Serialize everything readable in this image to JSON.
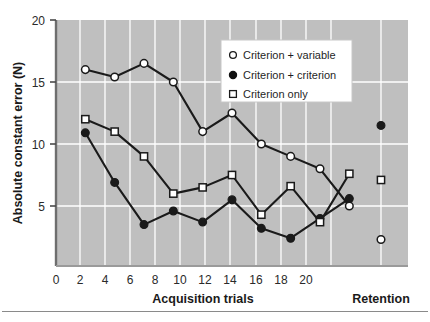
{
  "chart_data": {
    "type": "line",
    "title": "",
    "xlabel": "Acquisition trials",
    "ylabel": "Absolute constant error (N)",
    "x": [
      2,
      4,
      6,
      8,
      10,
      12,
      14,
      16,
      18,
      20
    ],
    "xticks": [
      0,
      2,
      4,
      6,
      8,
      10,
      12,
      14,
      16,
      18,
      20
    ],
    "xtick_labels": [
      "0",
      "2",
      "4",
      "6",
      "8",
      "10",
      "12",
      "14",
      "16",
      "18",
      "20"
    ],
    "yticks": [
      5,
      10,
      15,
      20
    ],
    "ytick_labels": [
      "5",
      "10",
      "15",
      "20"
    ],
    "xlim": [
      0,
      24
    ],
    "ylim": [
      0,
      20
    ],
    "grid": true,
    "grid_color": "#ffffff",
    "plot_bgcolor": "#bfbfbf",
    "legend_position": "upper right",
    "secondary_xlabel": "Retention",
    "retention_x": 22,
    "series": [
      {
        "name": "Criterion + variable",
        "marker": "open-circle",
        "color": "#1a1a1a",
        "fill": "#ffffff",
        "values": [
          16.0,
          15.4,
          16.5,
          15.0,
          11.0,
          12.5,
          10.0,
          9.0,
          8.0,
          5.0
        ],
        "retention_value": 2.3
      },
      {
        "name": "Criterion + criterion",
        "marker": "filled-circle",
        "color": "#1a1a1a",
        "fill": "#1a1a1a",
        "values": [
          10.9,
          6.9,
          3.5,
          4.6,
          3.7,
          5.5,
          3.2,
          2.4,
          4.0,
          5.6
        ],
        "retention_value": 11.5
      },
      {
        "name": "Criterion only",
        "marker": "open-square",
        "color": "#1a1a1a",
        "fill": "#ffffff",
        "values": [
          12.0,
          11.0,
          9.0,
          6.0,
          6.5,
          7.5,
          4.3,
          6.6,
          3.7,
          7.6
        ],
        "retention_value": 7.1
      }
    ]
  },
  "legend": {
    "items": [
      {
        "label": "Criterion + variable",
        "marker": "open-circle"
      },
      {
        "label": "Criterion + criterion",
        "marker": "filled-circle"
      },
      {
        "label": "Criterion only",
        "marker": "open-square"
      }
    ]
  },
  "axes": {
    "y_title": "Absolute constant error (N)",
    "x_title": "Acquisition trials",
    "retention_title": "Retention",
    "y_tick_0": "5",
    "y_tick_1": "10",
    "y_tick_2": "15",
    "y_tick_3": "20",
    "x_tick_0": "0",
    "x_tick_1": "2",
    "x_tick_2": "4",
    "x_tick_3": "6",
    "x_tick_4": "8",
    "x_tick_5": "10",
    "x_tick_6": "12",
    "x_tick_7": "14",
    "x_tick_8": "16",
    "x_tick_9": "18",
    "x_tick_10": "20"
  }
}
